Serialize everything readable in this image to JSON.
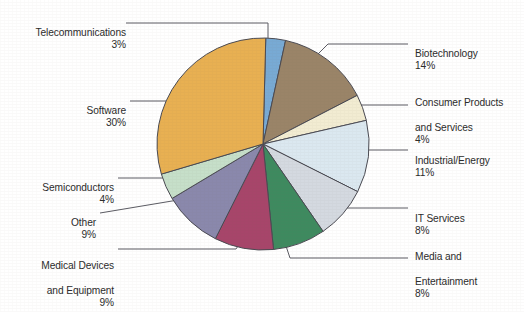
{
  "chart_data": {
    "type": "pie",
    "title": "",
    "subtitle": "",
    "xlabel": "",
    "ylabel": "",
    "legend_position": "callout-labels",
    "grid": false,
    "value_suffix": "%",
    "total": 100,
    "categories": [
      "Telecommunications",
      "Biotechnology",
      "Consumer Products and Services",
      "Industrial/Energy",
      "IT Services",
      "Media and Entertainment",
      "Medical Devices and Equipment",
      "Other",
      "Semiconductors",
      "Software"
    ],
    "values": [
      3,
      14,
      4,
      11,
      8,
      8,
      9,
      9,
      4,
      30
    ],
    "slices": [
      {
        "id": "telecommunications",
        "label": "Telecommunications",
        "value": 3,
        "display": "3%",
        "color": "#78aad4"
      },
      {
        "id": "biotechnology",
        "label": "Biotechnology",
        "value": 14,
        "display": "14%",
        "color": "#9a8468"
      },
      {
        "id": "consumer-products",
        "label": "Consumer Products and Services",
        "value": 4,
        "display": "4%",
        "color": "#f2ecd2"
      },
      {
        "id": "industrial-energy",
        "label": "Industrial/Energy",
        "value": 11,
        "display": "11%",
        "color": "#dbe8f0"
      },
      {
        "id": "it-services",
        "label": "IT Services",
        "value": 8,
        "display": "8%",
        "color": "#d4d9e0"
      },
      {
        "id": "media-entertainment",
        "label": "Media and Entertainment",
        "value": 8,
        "display": "8%",
        "color": "#3e8a5f"
      },
      {
        "id": "medical-devices",
        "label": "Medical Devices and Equipment",
        "value": 9,
        "display": "9%",
        "color": "#a7456a"
      },
      {
        "id": "other",
        "label": "Other",
        "value": 9,
        "display": "9%",
        "color": "#8a88ac"
      },
      {
        "id": "semiconductors",
        "label": "Semiconductors",
        "value": 4,
        "display": "4%",
        "color": "#c6dfc9"
      },
      {
        "id": "software",
        "label": "Software",
        "value": 30,
        "display": "30%",
        "color": "#e8b052"
      }
    ]
  },
  "labels": {
    "telecommunications": {
      "line1": "Telecommunications",
      "line2": "",
      "pct": "3%"
    },
    "software": {
      "line1": "Software",
      "line2": "",
      "pct": "30%"
    },
    "semiconductors": {
      "line1": "Semiconductors",
      "line2": "",
      "pct": "4%"
    },
    "other": {
      "line1": "Other",
      "line2": "",
      "pct": "9%"
    },
    "medical_devices": {
      "line1": "Medical Devices",
      "line2": "and Equipment",
      "pct": "9%"
    },
    "biotechnology": {
      "line1": "Biotechnology",
      "line2": "",
      "pct": "14%"
    },
    "consumer_products": {
      "line1": "Consumer Products",
      "line2": "and Services",
      "pct": "4%"
    },
    "industrial_energy": {
      "line1": "Industrial/Energy",
      "line2": "",
      "pct": "11%"
    },
    "it_services": {
      "line1": "IT Services",
      "line2": "",
      "pct": "8%"
    },
    "media_entertainment": {
      "line1": "Media and",
      "line2": "Entertainment",
      "pct": "8%"
    }
  },
  "style": {
    "background": "#ffffff",
    "text_color": "#2b2b2b",
    "outline_color": "#4a4a52",
    "leader_color": "#5a5a62"
  }
}
